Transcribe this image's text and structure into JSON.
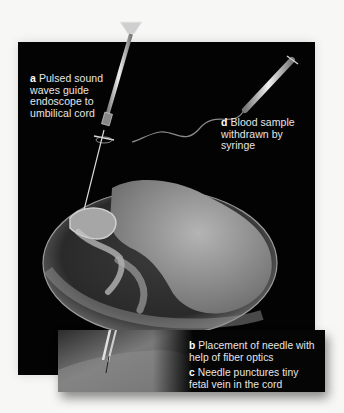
{
  "figure": {
    "labels": {
      "a": {
        "letter": "a",
        "text": "Pulsed sound waves guide endoscope to umbilical cord",
        "lines": [
          "Pulsed sound",
          "waves guide",
          "endoscope to",
          "umbilical cord"
        ]
      },
      "d": {
        "letter": "d",
        "text": "Blood sample withdrawn by syringe",
        "lines": [
          "Blood sample",
          "withdrawn by",
          "syringe"
        ]
      },
      "b": {
        "letter": "b",
        "text": "Placement of needle with help of fiber optics",
        "lines": [
          "Placement of needle with",
          "help of fiber optics"
        ]
      },
      "c": {
        "letter": "c",
        "text": "Needle punctures tiny fetal vein in the cord",
        "lines": [
          "Needle punctures tiny",
          "fetal vein in the cord"
        ]
      }
    },
    "colors": {
      "background": "#f7f7f5",
      "panel": "#030303",
      "text": "#e6e6e6",
      "instrument": "#d9d9d9",
      "amniotic_sac": "#4a4a4a",
      "fetus": "#9a9a9a"
    }
  }
}
